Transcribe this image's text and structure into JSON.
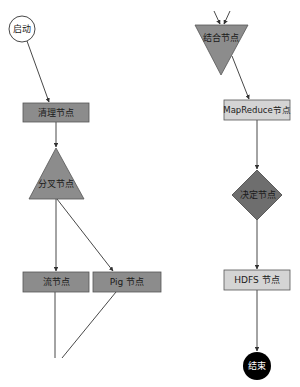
{
  "diagram": {
    "type": "workflow-flowchart",
    "colors": {
      "background": "#ffffff",
      "dark_node_fill": "#8c8c8c",
      "light_node_fill": "#d4d4d4",
      "diamond_fill": "#6e6e6e",
      "end_fill": "#000000",
      "edge": "#333333",
      "border": "#555555"
    },
    "nodes": {
      "start": {
        "label": "启动",
        "shape": "circle"
      },
      "cleanup": {
        "label": "清理节点",
        "shape": "rectangle"
      },
      "fork": {
        "label": "分叉节点",
        "shape": "triangle"
      },
      "stream": {
        "label": "流节点",
        "shape": "rectangle"
      },
      "pig": {
        "label": "Pig 节点",
        "shape": "rectangle"
      },
      "join": {
        "label": "结合节点",
        "shape": "inverted-triangle"
      },
      "mapreduce": {
        "label": "MapReduce节点",
        "shape": "rectangle"
      },
      "decision": {
        "label": "决定节点",
        "shape": "diamond"
      },
      "hdfs": {
        "label": "HDFS 节点",
        "shape": "rectangle"
      },
      "end": {
        "label": "结束",
        "shape": "circle"
      }
    },
    "edges": [
      {
        "from": "start",
        "to": "cleanup"
      },
      {
        "from": "cleanup",
        "to": "fork"
      },
      {
        "from": "fork",
        "to": "stream"
      },
      {
        "from": "fork",
        "to": "pig"
      },
      {
        "from": "stream",
        "to": "join"
      },
      {
        "from": "pig",
        "to": "join"
      },
      {
        "from": "join",
        "to": "mapreduce"
      },
      {
        "from": "mapreduce",
        "to": "decision"
      },
      {
        "from": "decision",
        "to": "hdfs"
      },
      {
        "from": "hdfs",
        "to": "end"
      }
    ]
  }
}
